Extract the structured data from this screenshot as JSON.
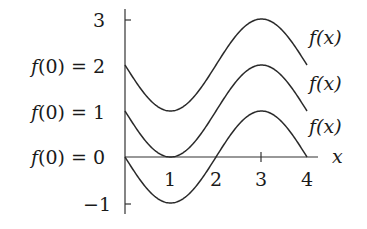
{
  "chart_data": {
    "type": "line",
    "title": "",
    "xlabel": "x",
    "ylabel": "",
    "xlim": [
      0,
      4
    ],
    "ylim": [
      -1,
      3
    ],
    "grid": false,
    "legend": "none",
    "x_ticks": [
      "1",
      "2",
      "3",
      "4"
    ],
    "y_ticks": [
      "3",
      "f(0) = 2",
      "f(0) = 1",
      "f(0) = 0",
      "−1"
    ],
    "function_form": "f(x) = f(0) − sin(πx/2)",
    "x": [
      0,
      0.5,
      1,
      1.5,
      2,
      2.5,
      3,
      3.5,
      4
    ],
    "series": [
      {
        "name": "f(x)",
        "f0": 2,
        "values": [
          2,
          1.29,
          1,
          1.29,
          2,
          2.71,
          3,
          2.71,
          2
        ]
      },
      {
        "name": "f(x)",
        "f0": 1,
        "values": [
          1,
          0.29,
          0,
          0.29,
          1,
          1.71,
          2,
          1.71,
          1
        ]
      },
      {
        "name": "f(x)",
        "f0": 0,
        "values": [
          0,
          -0.71,
          -1,
          -0.71,
          0,
          0.71,
          1,
          0.71,
          0
        ]
      }
    ],
    "annotations": [
      "f(x)",
      "f(x)",
      "f(x)"
    ]
  },
  "labels": {
    "y_top": "3",
    "y_f2": "f(0) = 2",
    "y_f1": "f(0) = 1",
    "y_f0": "f(0) = 0",
    "y_neg1": "−1",
    "x1": "1",
    "x2": "2",
    "x3": "3",
    "x4": "4",
    "x_axis": "x",
    "curve_label_top": "f(x)",
    "curve_label_mid": "f(x)",
    "curve_label_bot": "f(x)"
  }
}
